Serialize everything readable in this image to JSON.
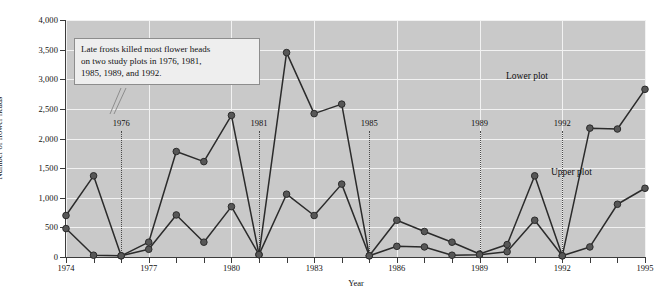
{
  "chart_data": {
    "type": "line",
    "title": "",
    "xlabel": "Year",
    "ylabel": "Number of flower heads",
    "xlim": [
      1974,
      1995
    ],
    "ylim": [
      0,
      4000
    ],
    "ytick_step": 500,
    "grid": true,
    "legend_position": "inline-labels",
    "x": [
      1974,
      1975,
      1976,
      1977,
      1978,
      1979,
      1980,
      1981,
      1982,
      1983,
      1984,
      1985,
      1986,
      1987,
      1988,
      1989,
      1990,
      1991,
      1992,
      1993,
      1994,
      1995
    ],
    "xtick_labels": [
      "1974",
      "1977",
      "1980",
      "1983",
      "1986",
      "1989",
      "1992",
      "1995"
    ],
    "xtick_values": [
      1974,
      1977,
      1980,
      1983,
      1986,
      1989,
      1992,
      1995
    ],
    "ytick_labels": [
      "0",
      "500",
      "1,000",
      "1,500",
      "2,000",
      "2,500",
      "3,000",
      "3,500",
      "4,000"
    ],
    "ytick_values": [
      0,
      500,
      1000,
      1500,
      2000,
      2500,
      3000,
      3500,
      4000
    ],
    "series": [
      {
        "name": "Lower plot",
        "values": [
          700,
          1370,
          20,
          250,
          1780,
          1610,
          2390,
          40,
          3450,
          2420,
          2580,
          20,
          620,
          430,
          250,
          50,
          210,
          1370,
          20,
          2175,
          2160,
          2830
        ]
      },
      {
        "name": "Upper plot",
        "values": [
          480,
          30,
          20,
          130,
          710,
          250,
          850,
          40,
          1060,
          700,
          1230,
          20,
          180,
          170,
          30,
          40,
          90,
          620,
          20,
          170,
          890,
          1160
        ]
      }
    ],
    "series_labels": [
      {
        "text": "Lower plot",
        "x_px": 506,
        "y_px": 72
      },
      {
        "text": "Upper plot",
        "x_px": 551,
        "y_px": 168
      }
    ],
    "annotation": {
      "lines": [
        "Late frosts killed most flower heads",
        "on two study plots in 1976, 1981,",
        "1985, 1989, and 1992."
      ],
      "points_to": 1976
    },
    "frost_years": [
      {
        "label": "1976",
        "year": 1976
      },
      {
        "label": "1981",
        "year": 1981
      },
      {
        "label": "1985",
        "year": 1985
      },
      {
        "label": "1989",
        "year": 1989
      },
      {
        "label": "1992",
        "year": 1992
      }
    ],
    "colors": {
      "plot_background": "#c9c9c9",
      "gridline": "#f2f2f2",
      "line": "#2b2b2b",
      "marker": "#575757",
      "marker_edge": "#2b2b2b",
      "axis": "#3b3b3b",
      "frost_line": "#4a4a4a",
      "callout_background": "#eeeeee",
      "callout_border": "#8d8d8d",
      "text": "#111111"
    }
  }
}
